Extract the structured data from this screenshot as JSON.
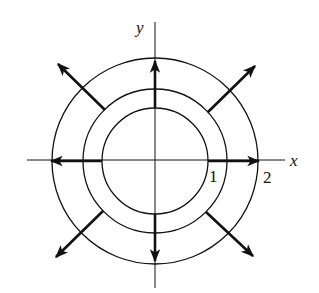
{
  "diagram": {
    "type": "vector-field",
    "axes": {
      "x_label": "x",
      "y_label": "y"
    },
    "tick_labels": [
      "1",
      "2"
    ],
    "circles": [
      {
        "name": "inner",
        "radius_units": 1
      },
      {
        "name": "middle",
        "radius_units": 1.35
      },
      {
        "name": "outer",
        "radius_units": 2
      }
    ],
    "arrows": [
      {
        "direction": "east"
      },
      {
        "direction": "west"
      },
      {
        "direction": "north"
      },
      {
        "direction": "south"
      },
      {
        "direction": "northeast"
      },
      {
        "direction": "northwest"
      },
      {
        "direction": "southeast"
      },
      {
        "direction": "southwest"
      }
    ],
    "colors": {
      "stroke": "#111111",
      "background": "#ffffff"
    }
  }
}
